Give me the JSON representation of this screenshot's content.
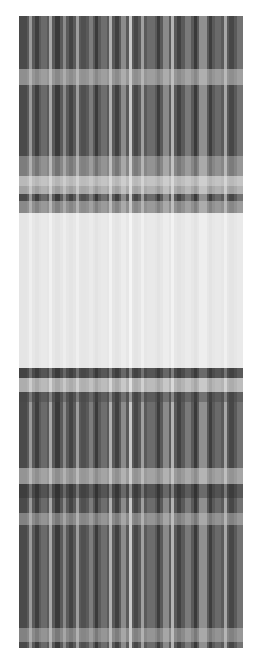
{
  "image": {
    "description": "Grayscale plaid-like texture with vertical stripes and a bright horizontal band",
    "width": 224,
    "height": 632,
    "offset": {
      "x": 19,
      "y": 16
    },
    "base_color": "#5a5a5a",
    "vertical_stripes": [
      {
        "x": 0,
        "w": 8,
        "c": "#4a4a4a"
      },
      {
        "x": 10,
        "w": 3,
        "c": "#9a9a9a"
      },
      {
        "x": 16,
        "w": 4,
        "c": "#3e3e3e"
      },
      {
        "x": 22,
        "w": 6,
        "c": "#6a6a6a"
      },
      {
        "x": 30,
        "w": 3,
        "c": "#a8a8a8"
      },
      {
        "x": 36,
        "w": 5,
        "c": "#3a3a3a"
      },
      {
        "x": 44,
        "w": 3,
        "c": "#8a8a8a"
      },
      {
        "x": 50,
        "w": 4,
        "c": "#444444"
      },
      {
        "x": 57,
        "w": 3,
        "c": "#9e9e9e"
      },
      {
        "x": 62,
        "w": 5,
        "c": "#505050"
      },
      {
        "x": 70,
        "w": 4,
        "c": "#7c7c7c"
      },
      {
        "x": 76,
        "w": 3,
        "c": "#3a3a3a"
      },
      {
        "x": 82,
        "w": 6,
        "c": "#6e6e6e"
      },
      {
        "x": 90,
        "w": 3,
        "c": "#b0b0b0"
      },
      {
        "x": 96,
        "w": 4,
        "c": "#404040"
      },
      {
        "x": 102,
        "w": 5,
        "c": "#8c8c8c"
      },
      {
        "x": 110,
        "w": 3,
        "c": "#c8c8c8"
      },
      {
        "x": 115,
        "w": 4,
        "c": "#474747"
      },
      {
        "x": 122,
        "w": 3,
        "c": "#a0a0a0"
      },
      {
        "x": 128,
        "w": 8,
        "c": "#6c6c6c"
      },
      {
        "x": 138,
        "w": 3,
        "c": "#3c3c3c"
      },
      {
        "x": 144,
        "w": 6,
        "c": "#8a8a8a"
      },
      {
        "x": 152,
        "w": 3,
        "c": "#b4b4b4"
      },
      {
        "x": 158,
        "w": 4,
        "c": "#424242"
      },
      {
        "x": 166,
        "w": 6,
        "c": "#7a7a7a"
      },
      {
        "x": 175,
        "w": 3,
        "c": "#3a3a3a"
      },
      {
        "x": 180,
        "w": 8,
        "c": "#909090"
      },
      {
        "x": 190,
        "w": 3,
        "c": "#3e3e3e"
      },
      {
        "x": 196,
        "w": 6,
        "c": "#6a6a6a"
      },
      {
        "x": 205,
        "w": 3,
        "c": "#a6a6a6"
      },
      {
        "x": 210,
        "w": 5,
        "c": "#474747"
      },
      {
        "x": 218,
        "w": 6,
        "c": "#727272"
      }
    ],
    "horizontal_bands": [
      {
        "y": 53,
        "h": 16,
        "c": "rgba(200,200,200,0.55)"
      },
      {
        "y": 140,
        "h": 30,
        "c": "rgba(220,220,220,0.35)"
      },
      {
        "y": 160,
        "h": 18,
        "c": "rgba(235,235,235,0.55)"
      },
      {
        "y": 185,
        "h": 12,
        "c": "rgba(200,200,200,0.5)"
      },
      {
        "y": 197,
        "h": 155,
        "c": "rgba(250,250,250,0.88)"
      },
      {
        "y": 352,
        "h": 10,
        "c": "rgba(60,60,60,0.45)"
      },
      {
        "y": 362,
        "h": 14,
        "c": "rgba(240,240,240,0.6)"
      },
      {
        "y": 376,
        "h": 10,
        "c": "rgba(70,70,70,0.4)"
      },
      {
        "y": 452,
        "h": 16,
        "c": "rgba(210,210,210,0.55)"
      },
      {
        "y": 468,
        "h": 14,
        "c": "rgba(40,40,40,0.35)"
      },
      {
        "y": 497,
        "h": 12,
        "c": "rgba(200,200,200,0.45)"
      },
      {
        "y": 612,
        "h": 14,
        "c": "rgba(200,200,200,0.45)"
      }
    ]
  }
}
